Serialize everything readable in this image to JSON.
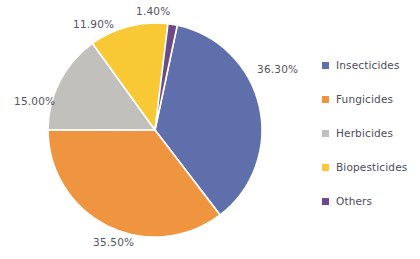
{
  "chart_data": {
    "type": "pie",
    "title": "",
    "subtitle": "",
    "xlabel": "",
    "ylabel": "",
    "grid": false,
    "legend_position": "right",
    "start_angle_deg": 12,
    "direction": "clockwise",
    "categories": [
      "Insecticides",
      "Fungicides",
      "Herbicides",
      "Biopesticides",
      "Others"
    ],
    "values": [
      36.3,
      35.5,
      15.0,
      11.9,
      1.4
    ],
    "value_suffix": "%",
    "labels": [
      "36.30%",
      "35.50%",
      "15.00%",
      "11.90%",
      "1.40%"
    ],
    "colors": [
      "#5f6fab",
      "#f0953f",
      "#c2c0bd",
      "#f9c835",
      "#6b4a8c"
    ],
    "slice_separator_color": "#ffffff",
    "label_color": "#54545f",
    "background_color": "#ffffff"
  },
  "labels": {
    "insecticides": "36.30%",
    "fungicides": "35.50%",
    "herbicides": "15.00%",
    "biopesticides": "11.90%",
    "others": "1.40%"
  },
  "legend": {
    "items": [
      {
        "label": "Insecticides",
        "color": "#5f6fab"
      },
      {
        "label": "Fungicides",
        "color": "#f0953f"
      },
      {
        "label": "Herbicides",
        "color": "#c2c0bd"
      },
      {
        "label": "Biopesticides",
        "color": "#f9c835"
      },
      {
        "label": "Others",
        "color": "#6b4a8c"
      }
    ]
  }
}
